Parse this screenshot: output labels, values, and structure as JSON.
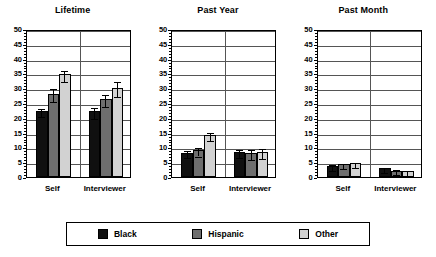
{
  "chart_data": {
    "type": "bar",
    "title": "",
    "xlabel": "",
    "ylabel": "",
    "ylim": [
      0,
      50
    ],
    "ytick_step": 5,
    "yticks": [
      0,
      5,
      10,
      15,
      20,
      25,
      30,
      35,
      40,
      45,
      50
    ],
    "grid": true,
    "legend_position": "bottom",
    "categories": [
      "Self",
      "Interviewer"
    ],
    "legend": [
      "Black",
      "Hispanic",
      "Other"
    ],
    "series_colors": {
      "Black": "#101010",
      "Hispanic": "#6e6e6e",
      "Other": "#d2d2d2"
    },
    "panels": [
      {
        "title": "Lifetime",
        "categories": [
          "Self",
          "Interviewer"
        ],
        "series": [
          {
            "name": "Black",
            "values": [
              22.2,
              22.2
            ],
            "errors": [
              1.3,
              1.9
            ]
          },
          {
            "name": "Hispanic",
            "values": [
              28.2,
              26.4
            ],
            "errors": [
              2.1,
              2.0
            ]
          },
          {
            "name": "Other",
            "values": [
              34.7,
              30.2
            ],
            "errors": [
              1.9,
              2.5
            ]
          }
        ]
      },
      {
        "title": "Past Year",
        "categories": [
          "Self",
          "Interviewer"
        ],
        "series": [
          {
            "name": "Black",
            "values": [
              8.2,
              8.4
            ],
            "errors": [
              1.1,
              1.4
            ]
          },
          {
            "name": "Hispanic",
            "values": [
              9.0,
              8.1
            ],
            "errors": [
              1.4,
              1.7
            ]
          },
          {
            "name": "Other",
            "values": [
              14.1,
              8.4
            ],
            "errors": [
              1.4,
              1.6
            ]
          }
        ]
      },
      {
        "title": "Past Month",
        "categories": [
          "Self",
          "Interviewer"
        ],
        "series": [
          {
            "name": "Black",
            "values": [
              3.7,
              2.9
            ],
            "errors": [
              1.0,
              0.9
            ]
          },
          {
            "name": "Hispanic",
            "values": [
              4.3,
              2.1
            ],
            "errors": [
              0.8,
              0.9
            ]
          },
          {
            "name": "Other",
            "values": [
              4.6,
              1.9
            ],
            "errors": [
              0.8,
              0.8
            ]
          }
        ]
      }
    ]
  },
  "legend": {
    "items": [
      {
        "label": "Black",
        "color": "#101010",
        "swatch": "legend-swatch-black"
      },
      {
        "label": "Hispanic",
        "color": "#6e6e6e",
        "swatch": "legend-swatch-hispanic"
      },
      {
        "label": "Other",
        "color": "#d2d2d2",
        "swatch": "legend-swatch-other"
      }
    ]
  }
}
